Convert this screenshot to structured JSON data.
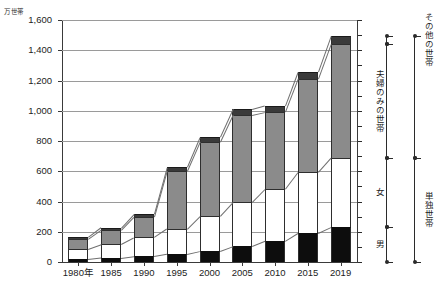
{
  "chart": {
    "title": "",
    "unit_label": "万世帯"
  },
  "axes": {
    "y_ticks": [
      "1,600",
      "1,400",
      "1,200",
      "1,000",
      "800",
      "600",
      "400",
      "200",
      "0"
    ],
    "x_ticks": [
      "1980年",
      "1985",
      "1990",
      "1995",
      "2000",
      "2005",
      "2010",
      "2015",
      "2019"
    ]
  },
  "legend": {
    "sonota": "その他の世帯",
    "fufu": "夫婦のみの世帯",
    "onna": "女",
    "otoko": "男",
    "tandoku": "単独世帯"
  },
  "colors": {
    "otoko": "#0d0d0d",
    "onna": "#ffffff",
    "fufu": "#8b8b8b",
    "sonota": "#3a3a3a",
    "grid": "#9a9a9a",
    "axis": "#3a3a3a"
  },
  "chart_data": {
    "type": "bar",
    "title": "",
    "xlabel": "",
    "ylabel": "万世帯",
    "ylim": [
      0,
      1600
    ],
    "ytick_step": 200,
    "grid": true,
    "legend_position": "right",
    "stacked": true,
    "categories": [
      "1980年",
      "1985",
      "1990",
      "1995",
      "2000",
      "2005",
      "2010",
      "2015",
      "2019"
    ],
    "series": [
      {
        "name": "男",
        "values": [
          19,
          28,
          40,
          55,
          74,
          105,
          139,
          192,
          231
        ]
      },
      {
        "name": "女",
        "values": [
          69,
          90,
          122,
          164,
          229,
          289,
          341,
          400,
          455
        ]
      },
      {
        "name": "夫婦のみの世帯",
        "values": [
          62,
          92,
          135,
          383,
          491,
          579,
          512,
          620,
          756
        ]
      },
      {
        "name": "その他の世帯",
        "values": [
          14,
          18,
          22,
          25,
          30,
          36,
          41,
          47,
          54
        ]
      }
    ],
    "totals": [
      164,
      228,
      319,
      627,
      824,
      1009,
      1033,
      1259,
      1496
    ]
  }
}
